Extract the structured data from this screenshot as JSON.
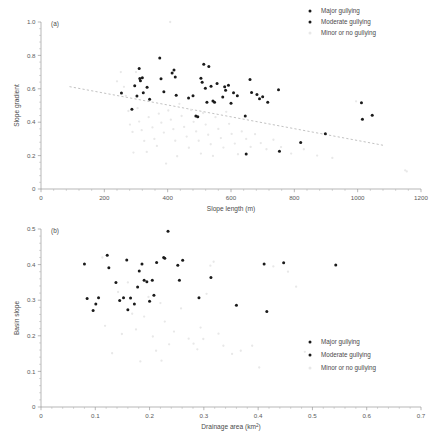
{
  "figure": {
    "title": "",
    "background": "#ffffff",
    "panel_tags": [
      "(a)",
      "(b)"
    ]
  },
  "legend": {
    "position": "top-right (panel a), bottom-right (panel b)",
    "entries": [
      {
        "label": "Major gullying",
        "color": "#1a1a1a",
        "marker": "filled-circle"
      },
      {
        "label": "Moderate gullying",
        "color": "#1a1a1a",
        "marker": "filled-circle"
      },
      {
        "label": "Minor or no gullying",
        "color": "#e8e8e8",
        "marker": "filled-circle"
      }
    ]
  },
  "chart_data": [
    {
      "type": "scatter",
      "panel": "(a)",
      "title": "",
      "xlabel": "Slope length (m)",
      "ylabel": "Slope gradient",
      "xlim": [
        0,
        1200
      ],
      "ylim": [
        0,
        1.0
      ],
      "xticks": [
        0,
        200,
        400,
        600,
        800,
        1000,
        1200
      ],
      "xticklabels": [
        "0",
        "200",
        "400",
        "600",
        "800",
        "1000",
        "1200"
      ],
      "yticks": [
        0,
        0.2,
        0.4,
        0.6,
        0.8,
        1.0
      ],
      "yticklabels": [
        "0",
        "0.2",
        "0.4",
        "0.6",
        "0.8",
        "1.0"
      ],
      "minor_ticks": true,
      "grid": false,
      "trendline": {
        "style": "dashed",
        "color": "#a8a8a8",
        "x": [
          90,
          1080
        ],
        "y": [
          0.613,
          0.262
        ]
      },
      "series": [
        {
          "name": "Major gullying",
          "color": "#1a1a1a",
          "points": [
            [
              254,
              0.575
            ],
            [
              287,
              0.477
            ],
            [
              296,
              0.618
            ],
            [
              303,
              0.557
            ],
            [
              310,
              0.722
            ],
            [
              312,
              0.662
            ],
            [
              314,
              0.648
            ],
            [
              320,
              0.666
            ],
            [
              323,
              0.576
            ],
            [
              335,
              0.61
            ],
            [
              343,
              0.537
            ],
            [
              375,
              0.785
            ],
            [
              379,
              0.66
            ],
            [
              388,
              0.583
            ],
            [
              414,
              0.695
            ],
            [
              420,
              0.712
            ],
            [
              424,
              0.671
            ],
            [
              427,
              0.562
            ],
            [
              466,
              0.545
            ],
            [
              480,
              0.558
            ],
            [
              489,
              0.437
            ],
            [
              495,
              0.432
            ],
            [
              505,
              0.663
            ],
            [
              509,
              0.639
            ],
            [
              514,
              0.747
            ],
            [
              519,
              0.603
            ],
            [
              524,
              0.519
            ],
            [
              530,
              0.733
            ],
            [
              537,
              0.616
            ],
            [
              543,
              0.527
            ],
            [
              548,
              0.519
            ],
            [
              556,
              0.631
            ],
            [
              574,
              0.551
            ],
            [
              580,
              0.613
            ],
            [
              583,
              0.592
            ],
            [
              592,
              0.622
            ],
            [
              600,
              0.514
            ],
            [
              608,
              0.576
            ],
            [
              620,
              0.558
            ],
            [
              645,
              0.437
            ],
            [
              648,
              0.21
            ],
            [
              660,
              0.655
            ],
            [
              665,
              0.578
            ],
            [
              682,
              0.566
            ],
            [
              690,
              0.54
            ],
            [
              700,
              0.553
            ],
            [
              716,
              0.519
            ],
            [
              750,
              0.595
            ],
            [
              753,
              0.226
            ],
            [
              820,
              0.279
            ],
            [
              898,
              0.331
            ],
            [
              1012,
              0.516
            ],
            [
              1015,
              0.417
            ],
            [
              1046,
              0.441
            ]
          ]
        },
        {
          "name": "Moderate gullying",
          "color": "#1a1a1a",
          "points": []
        },
        {
          "name": "Minor or no gullying",
          "color": "#e8e8e8",
          "points": [
            [
              240,
              0.645
            ],
            [
              262,
              0.612
            ],
            [
              268,
              0.558
            ],
            [
              276,
              0.467
            ],
            [
              281,
              0.386
            ],
            [
              289,
              0.342
            ],
            [
              292,
              0.218
            ],
            [
              305,
              0.484
            ],
            [
              310,
              0.404
            ],
            [
              318,
              0.352
            ],
            [
              326,
              0.288
            ],
            [
              334,
              0.222
            ],
            [
              340,
              0.43
            ],
            [
              352,
              0.369
            ],
            [
              358,
              0.3
            ],
            [
              366,
              0.258
            ],
            [
              372,
              0.451
            ],
            [
              380,
              0.397
            ],
            [
              388,
              0.338
            ],
            [
              395,
              0.152
            ],
            [
              402,
              0.47
            ],
            [
              410,
              0.415
            ],
            [
              418,
              0.358
            ],
            [
              424,
              0.289
            ],
            [
              430,
              0.196
            ],
            [
              437,
              0.51
            ],
            [
              444,
              0.437
            ],
            [
              452,
              0.372
            ],
            [
              460,
              0.314
            ],
            [
              467,
              0.247
            ],
            [
              474,
              0.472
            ],
            [
              482,
              0.402
            ],
            [
              490,
              0.345
            ],
            [
              498,
              0.289
            ],
            [
              505,
              0.212
            ],
            [
              512,
              0.455
            ],
            [
              520,
              0.386
            ],
            [
              528,
              0.325
            ],
            [
              536,
              0.268
            ],
            [
              543,
              0.198
            ],
            [
              551,
              0.43
            ],
            [
              560,
              0.36
            ],
            [
              568,
              0.305
            ],
            [
              576,
              0.248
            ],
            [
              585,
              0.462
            ],
            [
              594,
              0.39
            ],
            [
              602,
              0.33
            ],
            [
              612,
              0.272
            ],
            [
              622,
              0.208
            ],
            [
              634,
              0.345
            ],
            [
              648,
              0.3
            ],
            [
              662,
              0.252
            ],
            [
              676,
              0.328
            ],
            [
              694,
              0.275
            ],
            [
              712,
              0.238
            ],
            [
              734,
              0.295
            ],
            [
              758,
              0.251
            ],
            [
              790,
              0.212
            ],
            [
              830,
              0.238
            ],
            [
              872,
              0.2
            ],
            [
              920,
              0.186
            ],
            [
              995,
              0.525
            ],
            [
              1150,
              0.112
            ],
            [
              1155,
              0.105
            ],
            [
              408,
              1.0
            ],
            [
              252,
              0.7
            ],
            [
              300,
              0.7
            ]
          ]
        }
      ]
    },
    {
      "type": "scatter",
      "panel": "(b)",
      "title": "",
      "xlabel": "Drainage area (km2)",
      "xlabel_html": "Drainage area (km<sup>2</sup>)",
      "ylabel": "Basin slope",
      "xlim": [
        0,
        0.7
      ],
      "ylim": [
        0,
        0.5
      ],
      "xticks": [
        0,
        0.1,
        0.2,
        0.3,
        0.4,
        0.5,
        0.6,
        0.7
      ],
      "xticklabels": [
        "0",
        "0.1",
        "0.2",
        "0.3",
        "0.4",
        "0.5",
        "0.6",
        "0.7"
      ],
      "yticks": [
        0,
        0.1,
        0.2,
        0.3,
        0.4,
        0.5
      ],
      "yticklabels": [
        "0",
        "0.1",
        "0.2",
        "0.3",
        "0.4",
        "0.5"
      ],
      "minor_ticks": true,
      "grid": false,
      "trendline": null,
      "series": [
        {
          "name": "Major gullying",
          "color": "#1a1a1a",
          "points": [
            [
              0.08,
              0.402
            ],
            [
              0.085,
              0.305
            ],
            [
              0.096,
              0.271
            ],
            [
              0.101,
              0.289
            ],
            [
              0.106,
              0.307
            ],
            [
              0.122,
              0.426
            ],
            [
              0.125,
              0.391
            ],
            [
              0.138,
              0.35
            ],
            [
              0.145,
              0.299
            ],
            [
              0.152,
              0.307
            ],
            [
              0.158,
              0.413
            ],
            [
              0.16,
              0.273
            ],
            [
              0.165,
              0.306
            ],
            [
              0.172,
              0.289
            ],
            [
              0.178,
              0.337
            ],
            [
              0.181,
              0.382
            ],
            [
              0.186,
              0.402
            ],
            [
              0.19,
              0.356
            ],
            [
              0.195,
              0.352
            ],
            [
              0.2,
              0.297
            ],
            [
              0.205,
              0.356
            ],
            [
              0.208,
              0.314
            ],
            [
              0.213,
              0.406
            ],
            [
              0.226,
              0.42
            ],
            [
              0.228,
              0.418
            ],
            [
              0.234,
              0.494
            ],
            [
              0.252,
              0.398
            ],
            [
              0.255,
              0.356
            ],
            [
              0.261,
              0.412
            ],
            [
              0.291,
              0.307
            ],
            [
              0.313,
              0.364
            ],
            [
              0.36,
              0.286
            ],
            [
              0.411,
              0.402
            ],
            [
              0.416,
              0.268
            ],
            [
              0.447,
              0.405
            ],
            [
              0.543,
              0.399
            ]
          ]
        },
        {
          "name": "Moderate gullying",
          "color": "#1a1a1a",
          "points": []
        },
        {
          "name": "Minor or no gullying",
          "color": "#e8e8e8",
          "points": [
            [
              0.113,
              0.42
            ],
            [
              0.118,
              0.228
            ],
            [
              0.131,
              0.151
            ],
            [
              0.142,
              0.323
            ],
            [
              0.149,
              0.205
            ],
            [
              0.168,
              0.262
            ],
            [
              0.175,
              0.218
            ],
            [
              0.183,
              0.128
            ],
            [
              0.19,
              0.254
            ],
            [
              0.198,
              0.309
            ],
            [
              0.206,
              0.198
            ],
            [
              0.212,
              0.158
            ],
            [
              0.22,
              0.292
            ],
            [
              0.228,
              0.24
            ],
            [
              0.236,
              0.176
            ],
            [
              0.245,
              0.212
            ],
            [
              0.258,
              0.277
            ],
            [
              0.272,
              0.192
            ],
            [
              0.281,
              0.178
            ],
            [
              0.288,
              0.162
            ],
            [
              0.294,
              0.223
            ],
            [
              0.299,
              0.191
            ],
            [
              0.305,
              0.318
            ],
            [
              0.312,
              0.397
            ],
            [
              0.318,
              0.408
            ],
            [
              0.327,
              0.206
            ],
            [
              0.336,
              0.172
            ],
            [
              0.352,
              0.149
            ],
            [
              0.368,
              0.158
            ],
            [
              0.389,
              0.172
            ],
            [
              0.402,
              0.111
            ],
            [
              0.428,
              0.395
            ],
            [
              0.455,
              0.38
            ],
            [
              0.47,
              0.338
            ],
            [
              0.486,
              0.155
            ],
            [
              0.16,
              0.35
            ],
            [
              0.222,
              0.13
            ]
          ]
        }
      ]
    }
  ]
}
